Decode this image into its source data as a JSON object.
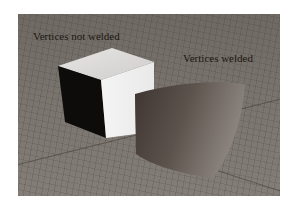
{
  "figure": {
    "labels": {
      "left": "Vertices not welded",
      "right": "Vertices welded"
    },
    "objects": [
      {
        "name": "unwelded-cube",
        "shading": "flat",
        "top_color": "#dcdcdc",
        "front_color": "#f2f2f2",
        "side_color": "#0d0b0a"
      },
      {
        "name": "welded-cube",
        "shading": "smooth",
        "color": "#5e544e"
      }
    ],
    "background": {
      "type": "perspective-grid",
      "color": "#7a746e"
    }
  }
}
